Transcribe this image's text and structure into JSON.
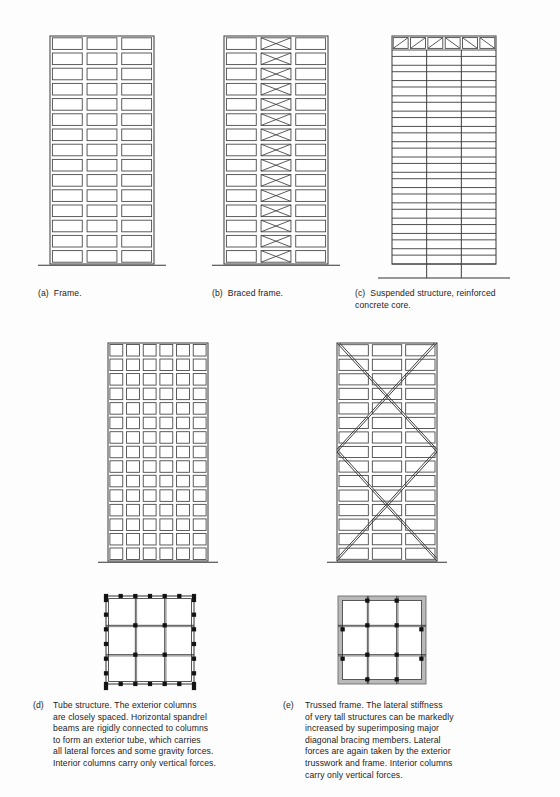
{
  "figure": {
    "background_color": "#fdfdfd",
    "line_color": "#3d3d3d",
    "column_marker_color": "#111111",
    "wall_fill_color": "#b9b9b9"
  },
  "panels": [
    {
      "id": "a",
      "tag": "(a)",
      "caption": "Frame.",
      "type": "elevation",
      "bays": 3,
      "floors": 15,
      "bracing": "none",
      "columns_to_ground": "all"
    },
    {
      "id": "b",
      "tag": "(b)",
      "caption": "Braced frame.",
      "type": "elevation",
      "bays": 3,
      "floors": 15,
      "bracing": "x-brace-center-bay-every-floor",
      "braced_bay_index": 1,
      "columns_to_ground": "all"
    },
    {
      "id": "c",
      "tag": "(c)",
      "caption": "Suspended structure, reinforced\nconcrete core.",
      "type": "elevation",
      "bays": 3,
      "floors": 15,
      "bracing": "hat-truss-at-top",
      "hat_truss_cells": 6,
      "hat_truss_diagonals": [
        "/",
        "/",
        "/",
        "\\",
        "\\",
        "\\"
      ],
      "columns_to_ground": "core-only",
      "core_lines": 2
    },
    {
      "id": "d",
      "tag": "(d)",
      "caption": "Tube structure. The exterior columns\nare closely spaced. Horizontal spandrel\nbeams are rigidly connected to columns\nto form an exterior tube, which carries\nall lateral forces and some gravity forces.\nInterior columns carry only vertical forces.",
      "type": "elevation-plus-plan",
      "bays": 6,
      "floors": 15,
      "bracing": "none",
      "cell_shape": "square",
      "plan": {
        "grid": 3,
        "perimeter_columns": "closely-spaced",
        "perimeter_wall": false,
        "interior_columns": true
      }
    },
    {
      "id": "e",
      "tag": "(e)",
      "caption": "Trussed frame. The lateral stiffness\nof very tall structures can be markedly\nincreased by superimposing major\ndiagonal bracing members. Lateral\nforces are again taken by the exterior\ntrusswork and frame. Interior columns\ncarry only vertical forces.",
      "type": "elevation-plus-plan",
      "bays": 3,
      "floors": 15,
      "bracing": "major-diagonal-double-x-full-width",
      "x_brace_count": 2,
      "plan": {
        "grid": 3,
        "perimeter_columns": "none",
        "perimeter_wall": true,
        "interior_columns": true
      }
    }
  ],
  "labels": {
    "a_full": "(a)  Frame.",
    "b_full": "(b)  Braced frame.",
    "c_full": "(c)  Suspended structure, reinforced\n      concrete core."
  }
}
